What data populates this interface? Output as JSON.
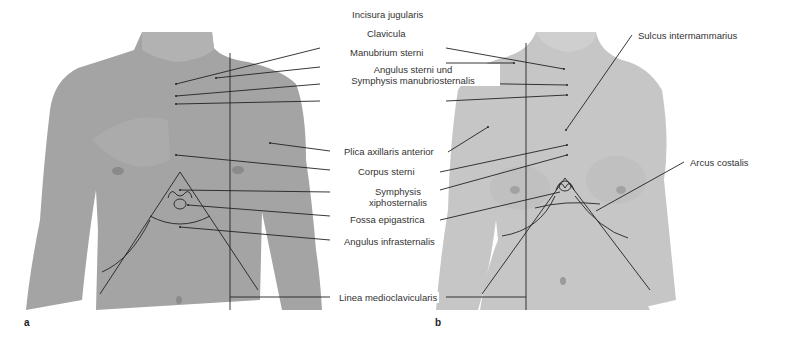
{
  "figure": {
    "panels": [
      {
        "letter": "a",
        "subject": "male-torso-anterior"
      },
      {
        "letter": "b",
        "subject": "female-torso-anterior"
      }
    ],
    "labels": {
      "incisura_jugularis": "Incisura jugularis",
      "clavicula": "Clavicula",
      "manubrium_sterni": "Manubrium sterni",
      "angulus_sterni_1": "Angulus sterni und",
      "angulus_sterni_2": "Symphysis manubriosternalis",
      "plica_axillaris": "Plica axillaris anterior",
      "corpus_sterni": "Corpus sterni",
      "symphysis_xipho_1": "Symphysis",
      "symphysis_xipho_2": "xiphosternalis",
      "fossa_epigastrica": "Fossa epigastrica",
      "angulus_infrasternalis": "Angulus infrasternalis",
      "linea_medioclavicularis": "Linea medioclavicularis",
      "sulcus_intermammarius": "Sulcus intermammarius",
      "arcus_costalis": "Arcus costalis"
    },
    "colors": {
      "skin_male": "#a9a9a9",
      "skin_female": "#c8c8c8",
      "line": "#222222",
      "text": "#333333"
    }
  }
}
